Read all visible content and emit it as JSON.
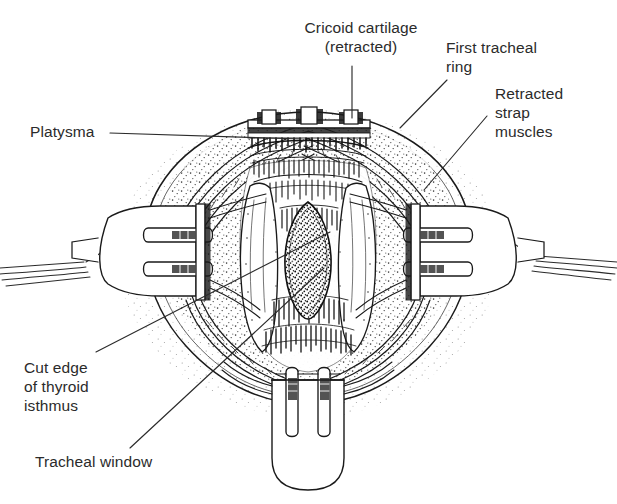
{
  "figure": {
    "domain": "Diagram",
    "background_color": "#ffffff",
    "ink_color": "#1a1a1a",
    "text_color": "#2b2b2b"
  },
  "labels": [
    {
      "id": "cricoid-cartilage",
      "text": "Cricoid cartilage\n(retracted)",
      "x": 286,
      "y": 18,
      "width": 150,
      "align": "center",
      "leader": {
        "type": "line",
        "points": "352,66 352,118"
      }
    },
    {
      "id": "first-tracheal-ring",
      "text": "First tracheal\nring",
      "x": 446,
      "y": 38,
      "width": 120,
      "align": "left",
      "leader": {
        "type": "line",
        "points": "447,80 400,128"
      }
    },
    {
      "id": "retracted-strap-muscles",
      "text": "Retracted\nstrap\nmuscles",
      "x": 495,
      "y": 84,
      "width": 110,
      "align": "left",
      "leader": {
        "type": "line",
        "points": "487,116 424,190"
      }
    },
    {
      "id": "platysma",
      "text": "Platysma",
      "x": 30,
      "y": 122,
      "width": 90,
      "align": "left",
      "leader": {
        "type": "line",
        "points": "110,133 301,139"
      }
    },
    {
      "id": "cut-edge-of-thyroid-isthmus",
      "text": "Cut edge\nof thyroid\nisthmus",
      "x": 24,
      "y": 358,
      "width": 120,
      "align": "left",
      "leader": {
        "type": "line",
        "points": "96,352 330,232"
      }
    },
    {
      "id": "tracheal-window",
      "text": "Tracheal window",
      "x": 35,
      "y": 452,
      "width": 160,
      "align": "left",
      "leader": {
        "type": "line",
        "points": "130,448 324,268"
      }
    }
  ],
  "anatomy": {
    "wound_outline": "rhomboid oval neck incision",
    "structures": [
      {
        "name": "skin-and-subcutaneous-fat",
        "texture": "stipple"
      },
      {
        "name": "platysma-cut-edge",
        "texture": "layered-lines"
      },
      {
        "name": "strap-muscle-left",
        "texture": "pale-band"
      },
      {
        "name": "strap-muscle-right",
        "texture": "pale-band"
      },
      {
        "name": "cricoid-cartilage",
        "texture": "hatched"
      },
      {
        "name": "first-tracheal-ring",
        "texture": "hatched"
      },
      {
        "name": "thyroid-isthmus-cut-edge",
        "texture": "hatched"
      },
      {
        "name": "tracheal-window",
        "texture": "dense-stipple"
      }
    ]
  },
  "instruments": [
    {
      "name": "retractor-top",
      "prongs": 3,
      "position": "superior"
    },
    {
      "name": "retractor-left",
      "prongs": 2,
      "position": "left-lateral"
    },
    {
      "name": "retractor-right",
      "prongs": 2,
      "position": "right-lateral"
    },
    {
      "name": "retractor-bottom",
      "prongs": 2,
      "position": "inferior"
    }
  ]
}
